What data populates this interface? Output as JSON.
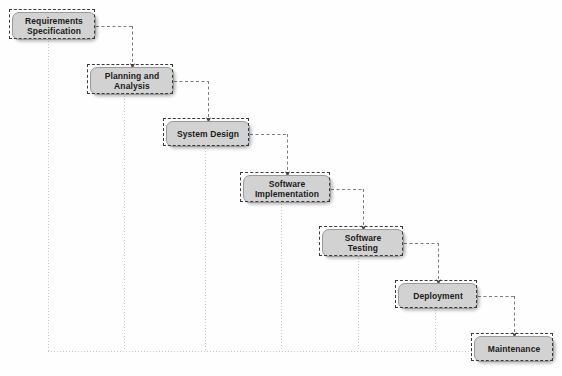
{
  "diagram": {
    "type": "flowchart",
    "canvas": {
      "width": 562,
      "height": 376,
      "background": "#fefefe"
    },
    "style": {
      "node_fill": "#d2d2d2",
      "node_border": "#9a9a9a",
      "node_text": "#1b1b1b",
      "connector_color": "#7d7d7d",
      "guide_color": "#c9c9c9",
      "selection_border": "#3b3b3b"
    },
    "nodes": [
      {
        "id": "requirements-specification",
        "label": "Requirements\nSpecification",
        "x": 12,
        "y": 12,
        "w": 84,
        "h": 28
      },
      {
        "id": "planning-and-analysis",
        "label": "Planning and\nAnalysis",
        "x": 90,
        "y": 67,
        "w": 84,
        "h": 28
      },
      {
        "id": "system-design",
        "label": "System Design",
        "x": 166,
        "y": 121,
        "w": 84,
        "h": 26
      },
      {
        "id": "software-implementation",
        "label": "Software\nImplementation",
        "x": 243,
        "y": 175,
        "w": 88,
        "h": 28
      },
      {
        "id": "software-testing",
        "label": "Software\nTesting",
        "x": 322,
        "y": 229,
        "w": 82,
        "h": 28
      },
      {
        "id": "deployment",
        "label": "Deployment",
        "x": 398,
        "y": 283,
        "w": 80,
        "h": 26
      },
      {
        "id": "maintenance",
        "label": "Maintenance",
        "x": 474,
        "y": 336,
        "w": 80,
        "h": 26
      }
    ],
    "connectors": [
      {
        "id": "req-to-plan",
        "from": "requirements-specification",
        "to": "planning-and-analysis",
        "from_x": 96,
        "from_y": 26,
        "mid_x": 132,
        "to_x": 132,
        "to_y": 67
      },
      {
        "id": "plan-to-design",
        "from": "planning-and-analysis",
        "to": "system-design",
        "from_x": 174,
        "from_y": 81,
        "mid_x": 208,
        "to_x": 208,
        "to_y": 121
      },
      {
        "id": "design-to-impl",
        "from": "system-design",
        "to": "software-implementation",
        "from_x": 250,
        "from_y": 134,
        "mid_x": 287,
        "to_x": 287,
        "to_y": 175
      },
      {
        "id": "impl-to-test",
        "from": "software-implementation",
        "to": "software-testing",
        "from_x": 331,
        "from_y": 189,
        "mid_x": 363,
        "to_x": 363,
        "to_y": 229
      },
      {
        "id": "test-to-deploy",
        "from": "software-testing",
        "to": "deployment",
        "from_x": 404,
        "from_y": 243,
        "mid_x": 438,
        "to_x": 438,
        "to_y": 283
      },
      {
        "id": "deploy-to-main",
        "from": "deployment",
        "to": "maintenance",
        "from_x": 478,
        "from_y": 296,
        "mid_x": 514,
        "to_x": 514,
        "to_y": 336
      }
    ],
    "guides": {
      "baseline_y": 351,
      "baseline_x1": 48,
      "baseline_x2": 474,
      "verticals": [
        {
          "id": "guide-requirements",
          "x": 48,
          "y1": 41
        },
        {
          "id": "guide-planning",
          "x": 124,
          "y1": 96
        },
        {
          "id": "guide-design",
          "x": 205,
          "y1": 148
        },
        {
          "id": "guide-implementation",
          "x": 281,
          "y1": 204
        },
        {
          "id": "guide-testing",
          "x": 358,
          "y1": 258
        },
        {
          "id": "guide-deployment",
          "x": 435,
          "y1": 310
        }
      ]
    },
    "selection": {
      "note": "dashed selection outlines around each node",
      "inset": 3
    }
  }
}
